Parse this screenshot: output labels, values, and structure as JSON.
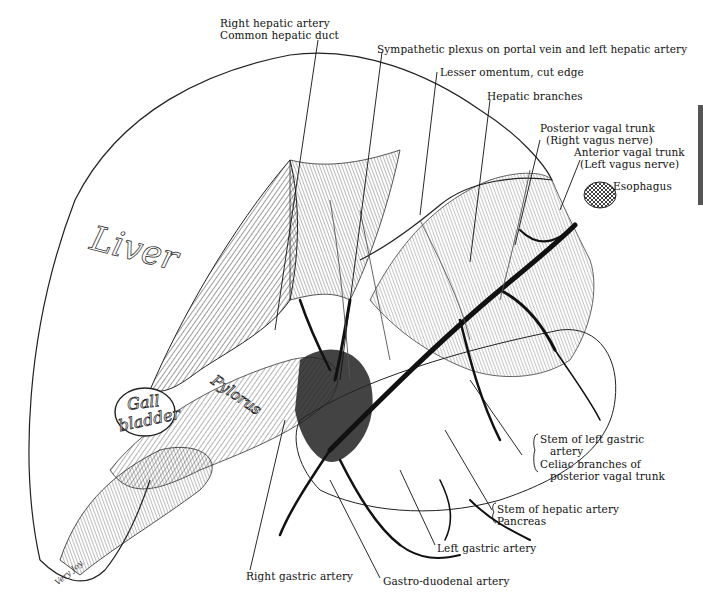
{
  "figure": {
    "type": "anatomical illustration",
    "signature": "Very Joy."
  },
  "organ_labels": {
    "liver": "Liver",
    "gall_bladder_line1": "Gall",
    "gall_bladder_line2": "bladder",
    "pylorus": "Pylorus"
  },
  "labels": {
    "right_hepatic_artery": "Right hepatic artery",
    "common_hepatic_duct": "Common hepatic duct",
    "sympathetic_plexus": "Sympathetic plexus on portal vein and left hepatic artery",
    "lesser_omentum": "Lesser omentum, cut edge",
    "hepatic_branches": "Hepatic branches",
    "posterior_vagal_trunk": "Posterior vagal trunk",
    "posterior_vagal_trunk_sub": "(Right vagus nerve)",
    "anterior_vagal_trunk": "Anterior vagal trunk",
    "anterior_vagal_trunk_sub": "(Left vagus nerve)",
    "esophagus": "Esophagus",
    "stem_left_gastric_1": "Stem of left gastric",
    "stem_left_gastric_2": "artery",
    "celiac_branches_1": "Celiac branches of",
    "celiac_branches_2": "posterior vagal trunk",
    "stem_hepatic_artery": "Stem of hepatic artery",
    "pancreas": "Pancreas",
    "left_gastric_artery": "Left gastric artery",
    "right_gastric_artery": "Right gastric artery",
    "gastro_duodenal_artery": "Gastro-duodenal artery"
  },
  "colors": {
    "ink": "#111111",
    "paper": "#ffffff",
    "shade": "#555555"
  }
}
